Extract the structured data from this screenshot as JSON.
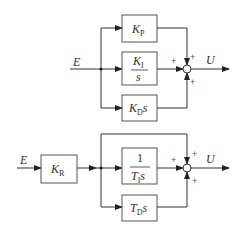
{
  "diagrams": [
    {
      "name": "parallel-pid",
      "input": "E",
      "output": "U",
      "blocks": [
        {
          "id": "kp",
          "main": "K",
          "sub": "P"
        },
        {
          "id": "ki",
          "num_main": "K",
          "num_sub": "I",
          "den": "s"
        },
        {
          "id": "kd",
          "main": "K",
          "sub": "D",
          "suffix": "s"
        }
      ],
      "sum_signs": [
        "+",
        "+",
        "+"
      ]
    },
    {
      "name": "standard-pid",
      "input": "E",
      "output": "U",
      "blocks": [
        {
          "id": "kr",
          "main": "K",
          "sub": "R"
        },
        {
          "id": "ti",
          "num": "1",
          "den_main": "T",
          "den_sub": "I",
          "den_suffix": "s"
        },
        {
          "id": "td",
          "main": "T",
          "sub": "D",
          "suffix": "s"
        }
      ],
      "sum_signs": [
        "+",
        "+",
        "+"
      ]
    }
  ],
  "colors": {
    "line": "#333333",
    "box": "#555555"
  }
}
